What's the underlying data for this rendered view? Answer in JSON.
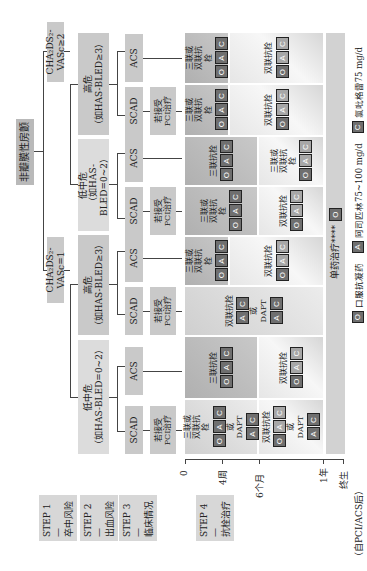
{
  "root": {
    "label": "非瓣膜性房颤"
  },
  "step1": {
    "label": "CHA₂DS₂-VASc≥2",
    "label_eq1": "CHA₂DS₂-VASc=1"
  },
  "step2": {
    "high": {
      "title": "高危",
      "sub": "（如HAS-BLED≥3）"
    },
    "low": {
      "title": "低中危",
      "sub": "（如HAS-BLED=0~2）"
    }
  },
  "step3": {
    "scad": "SCAD",
    "acs": "ACS",
    "pci": "若接受PCI治疗"
  },
  "treatments": {
    "triple_or_dual": "三联或双联抗栓",
    "dual": "双联抗栓",
    "triple": "三联抗栓",
    "or": "或",
    "dapt": "DAPT",
    "mono": "单药治疗****"
  },
  "drugs": {
    "O": "O",
    "A": "A",
    "C": "C"
  },
  "timeline": {
    "ticks": [
      "0",
      "4周",
      "6个月",
      "1年",
      "终生"
    ],
    "note": "（自PCI/ACS后）"
  },
  "steps": [
    {
      "label": "STEP 1—",
      "sub": "卒中风险"
    },
    {
      "label": "STEP 2—",
      "sub": "出血风险"
    },
    {
      "label": "STEP 3—",
      "sub": "临床情况"
    },
    {
      "label": "STEP 4—",
      "sub": "抗栓治疗"
    }
  ],
  "legend": [
    {
      "key": "O",
      "label": "口服抗凝药"
    },
    {
      "key": "A",
      "label": "阿司匹林75~100 mg/d"
    },
    {
      "key": "C",
      "label": "氯吡格雷75 mg/d"
    }
  ]
}
